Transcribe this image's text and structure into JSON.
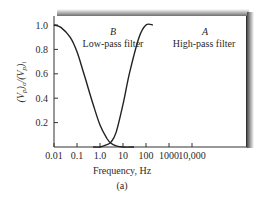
{
  "chart_data": {
    "type": "line",
    "title": "",
    "caption": "(a)",
    "xlabel": "Frequency, Hz",
    "ylabel": "(Vp)o/(Vp)i",
    "xscale": "log",
    "xlim": [
      0.01,
      10000
    ],
    "ylim": [
      0,
      1.0
    ],
    "x_ticks": [
      "0.01",
      "0.1",
      "1.0",
      "10",
      "100",
      "1000",
      "10,000"
    ],
    "y_ticks": [
      "0.2",
      "0.4",
      "0.6",
      "0.8",
      "1.0"
    ],
    "grid": false,
    "series": [
      {
        "name": "Low-pass filter",
        "label": "B",
        "x": [
          0.01,
          0.02,
          0.05,
          0.1,
          0.2,
          0.5,
          1,
          2,
          3,
          5,
          10,
          30
        ],
        "y": [
          1.0,
          0.98,
          0.9,
          0.78,
          0.6,
          0.35,
          0.18,
          0.07,
          0.03,
          0.01,
          0.0,
          0.0
        ]
      },
      {
        "name": "High-pass filter",
        "label": "A",
        "x": [
          0.5,
          1,
          2,
          3,
          5,
          10,
          20,
          50,
          100,
          200
        ],
        "y": [
          0.0,
          0.0,
          0.02,
          0.04,
          0.12,
          0.35,
          0.62,
          0.9,
          1.0,
          1.0
        ]
      }
    ],
    "annotations": [
      {
        "text": "B",
        "sub": "Low-pass filter"
      },
      {
        "text": "A",
        "sub": "High-pass filter"
      }
    ]
  }
}
